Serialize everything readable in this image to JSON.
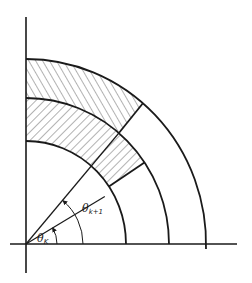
{
  "diagram": {
    "type": "polar-quadrant-annular-sectors",
    "origin": {
      "x": 26,
      "y": 244
    },
    "radii": {
      "inner": {
        "rx": 100,
        "ry": 103
      },
      "middle": {
        "rx": 143,
        "ry": 146
      },
      "outer": {
        "rx": 180,
        "ry": 185
      }
    },
    "rays": [
      {
        "name": "theta-k-ray",
        "angle_deg": 31,
        "length": 92
      },
      {
        "name": "theta-k1-ray",
        "angle_deg": 49.5,
        "length": "to middle arc"
      }
    ],
    "hatched_regions": [
      {
        "name": "inner-band",
        "r_from": "inner",
        "r_to": "middle",
        "angle_from_deg": 34,
        "angle_to_deg": 90,
        "hatch": "diagonal-down"
      },
      {
        "name": "outer-band",
        "r_from": "middle",
        "r_to": "outer",
        "angle_from_deg": 49.5,
        "angle_to_deg": 90,
        "hatch": "diagonal-up"
      }
    ],
    "labels": {
      "theta_k": {
        "symbol": "θ",
        "subscript": "K"
      },
      "theta_k1": {
        "symbol": "θ",
        "subscript": "k+1"
      }
    },
    "colors": {
      "ink": "#1a1a1a",
      "hatch": "#555555",
      "background": "#ffffff"
    }
  }
}
